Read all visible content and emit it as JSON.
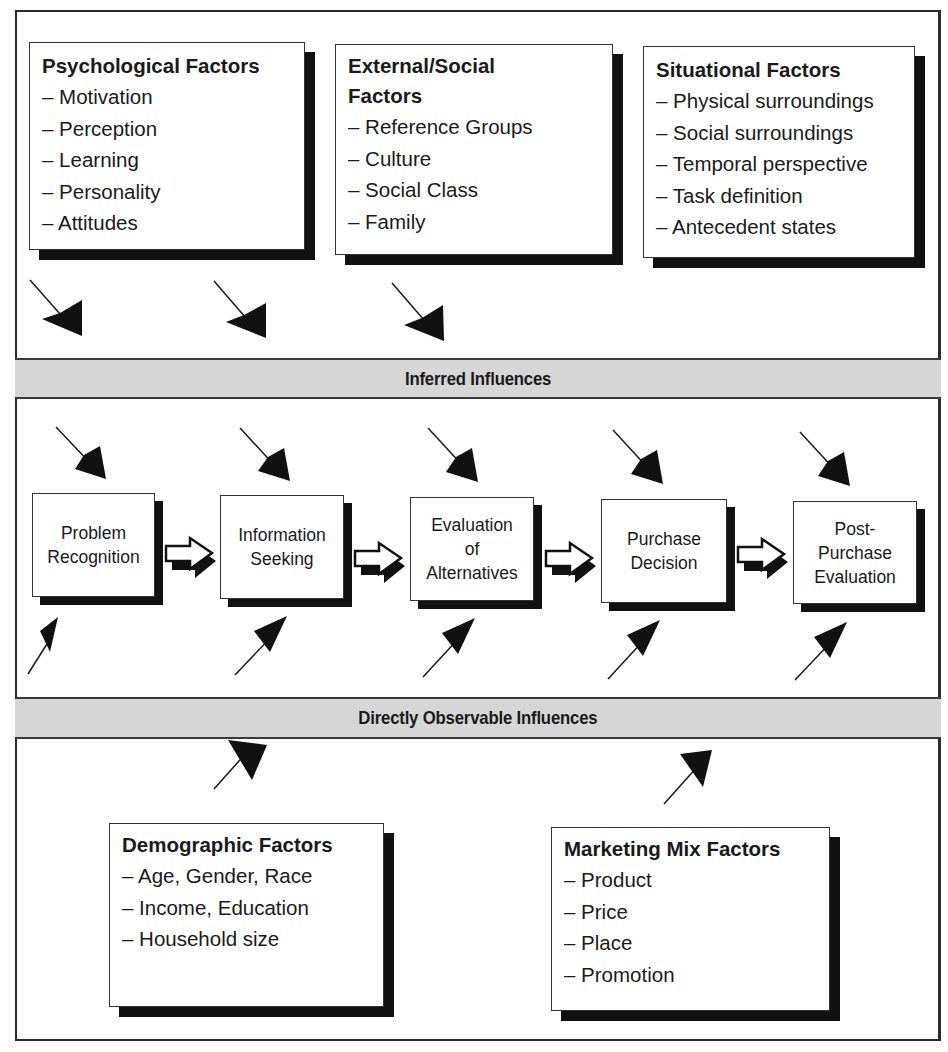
{
  "diagram": {
    "top_factors": [
      {
        "title": "Psychological Factors",
        "items": [
          "– Motivation",
          "– Perception",
          "– Learning",
          "– Personality",
          "– Attitudes"
        ]
      },
      {
        "title_line1": "External/Social",
        "title_line2": "Factors",
        "items": [
          "– Reference Groups",
          "– Culture",
          "– Social Class",
          "– Family"
        ]
      },
      {
        "title": "Situational Factors",
        "items": [
          "– Physical surroundings",
          "– Social surroundings",
          "– Temporal perspective",
          "– Task definition",
          "– Antecedent states"
        ]
      }
    ],
    "bands": {
      "inferred": "Inferred Influences",
      "observable": "Directly Observable Influences"
    },
    "process_steps": [
      {
        "label": "Problem\nRecognition"
      },
      {
        "label": "Information\nSeeking"
      },
      {
        "label": "Evaluation\nof\nAlternatives"
      },
      {
        "label": "Purchase\nDecision"
      },
      {
        "label": "Post-\nPurchase\nEvaluation"
      }
    ],
    "bottom_factors": [
      {
        "title": "Demographic Factors",
        "items": [
          "– Age, Gender, Race",
          "– Income, Education",
          "– Household size"
        ]
      },
      {
        "title": "Marketing Mix Factors",
        "items": [
          "– Product",
          "– Price",
          "– Place",
          "– Promotion"
        ]
      }
    ],
    "colors": {
      "band_fill": "#d6d6d6",
      "shadow": "#111111",
      "line": "#2a2a2a"
    }
  }
}
